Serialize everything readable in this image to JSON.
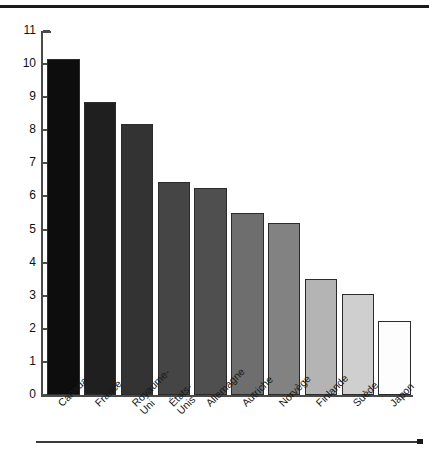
{
  "chart_data": {
    "type": "bar",
    "title": "",
    "subtitle": "",
    "xlabel": "",
    "ylabel": "",
    "categories": [
      "Canada",
      "France",
      "Royaume-\nUni",
      "États-\nUnis",
      "Allemagne",
      "Autriche",
      "Norvège",
      "Finlande",
      "Suède",
      "Japon"
    ],
    "values": [
      10.15,
      8.85,
      8.2,
      6.45,
      6.25,
      5.5,
      5.2,
      3.5,
      3.05,
      2.25
    ],
    "bar_colors": [
      "#0d0d0d",
      "#1f1f1f",
      "#333333",
      "#454545",
      "#4f4f4f",
      "#6e6e6e",
      "#828282",
      "#b4b4b4",
      "#cfcfcf",
      "#fdfdfd"
    ],
    "ylim": [
      0,
      11
    ],
    "ytick_values": [
      0,
      1,
      2,
      3,
      4,
      5,
      6,
      7,
      8,
      9,
      10,
      11
    ],
    "ytick_labels": [
      "0",
      "1",
      "2",
      "3",
      "4",
      "5",
      "6",
      "7",
      "8",
      "9",
      "10",
      "11"
    ],
    "grid": false,
    "legend": null,
    "annotations": []
  },
  "figure": {
    "top_rule": "top-rule",
    "bottom_rule": "bottom-rule"
  }
}
